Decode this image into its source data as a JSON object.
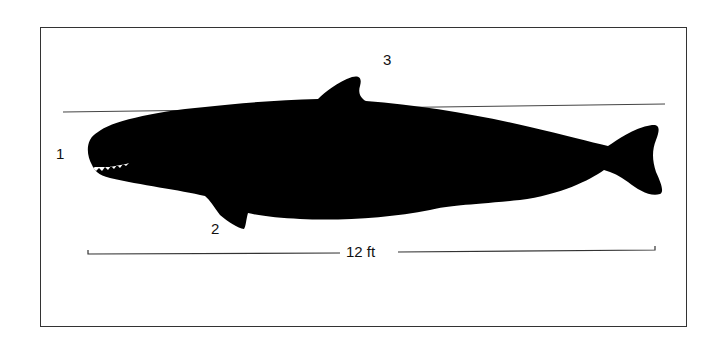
{
  "figure": {
    "labels": [
      {
        "id": "1",
        "text": "1"
      },
      {
        "id": "2",
        "text": "2"
      },
      {
        "id": "3",
        "text": "3"
      }
    ],
    "scale_bar": {
      "text": "12 ft"
    }
  },
  "colors": {
    "silhouette": "#000000",
    "lines": "#333333",
    "background": "#ffffff"
  }
}
